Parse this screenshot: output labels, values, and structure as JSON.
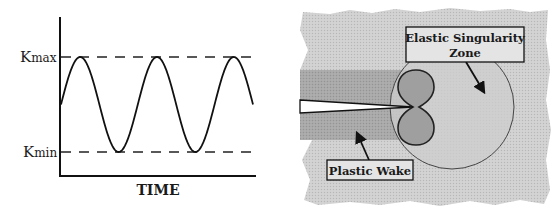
{
  "chart_data": {
    "type": "line",
    "title": "",
    "xlabel": "TIME",
    "ylabel": "",
    "y_levels": [
      {
        "name": "Kmax",
        "label_main": "K",
        "label_sub": "max",
        "value": 1
      },
      {
        "name": "Kmin",
        "label_main": "K",
        "label_sub": "min",
        "value": -1
      }
    ],
    "series": [
      {
        "name": "stress-intensity-cycle",
        "shape": "sine",
        "amplitude": 1,
        "cycles_shown": 2.5,
        "start_phase": "mid-rising",
        "end_phase": "mid-falling"
      }
    ],
    "ylim": [
      -1.55,
      1.55
    ],
    "grid": false
  },
  "diagram": {
    "labels": {
      "elastic_zone_line1": "Elastic Singularity",
      "elastic_zone_line2": "Zone",
      "plastic_wake": "Plastic Wake"
    },
    "colors": {
      "background_material": "#d2d2d2",
      "wake_band": "#a9a9a9",
      "plastic_zone": "#9e9e9e",
      "elastic_zone": "#cbcbcb",
      "outline": "#222222"
    }
  }
}
